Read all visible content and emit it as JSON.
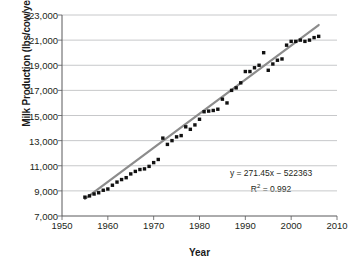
{
  "chart_data": {
    "type": "scatter",
    "title": "",
    "xlabel": "Year",
    "ylabel": "Milk Production (lbs/cow/year)",
    "xlim": [
      1950,
      2010
    ],
    "ylim": [
      7000,
      23000
    ],
    "xticks": [
      "1950",
      "1960",
      "1970",
      "1980",
      "1990",
      "2000",
      "2010"
    ],
    "xtick_values": [
      1950,
      1960,
      1970,
      1980,
      1990,
      2000,
      2010
    ],
    "yticks": [
      "7,000",
      "9,000",
      "11,000",
      "13,000",
      "15,000",
      "17,000",
      "19,000",
      "21,000",
      "23,000"
    ],
    "ytick_values": [
      7000,
      9000,
      11000,
      13000,
      15000,
      17000,
      19000,
      21000,
      23000
    ],
    "grid": "horizontal",
    "legend": "none",
    "marker_color": "#111111",
    "trendline_color": "#8c8c8c",
    "annotations": [
      "y = 271.45x − 522363",
      "R² = 0.992"
    ],
    "equation": "y = 271.45x − 522363",
    "r_squared_label": "R",
    "r_squared_sup": "2",
    "r_squared_value": "= 0.992",
    "slope": 271.45,
    "intercept": -522363,
    "r_squared": 0.992,
    "series": [
      {
        "name": "Milk production per cow",
        "x": [
          1955,
          1956,
          1957,
          1958,
          1959,
          1960,
          1961,
          1962,
          1963,
          1964,
          1965,
          1966,
          1967,
          1968,
          1969,
          1970,
          1971,
          1972,
          1973,
          1974,
          1975,
          1976,
          1977,
          1978,
          1979,
          1980,
          1981,
          1982,
          1983,
          1984,
          1985,
          1986,
          1987,
          1988,
          1989,
          1990,
          1991,
          1992,
          1993,
          1994,
          1995,
          1996,
          1997,
          1998,
          1999,
          2000,
          2001,
          2002,
          2003,
          2004,
          2005,
          2006
        ],
        "y": [
          8500,
          8600,
          8750,
          8850,
          9050,
          9150,
          9450,
          9700,
          9900,
          10050,
          10350,
          10550,
          10700,
          10750,
          10950,
          11250,
          11500,
          13200,
          12700,
          13000,
          13300,
          13400,
          14100,
          13900,
          14250,
          14700,
          15300,
          15350,
          15400,
          15500,
          16300,
          16000,
          17000,
          17200,
          17600,
          18500,
          18500,
          18800,
          19000,
          20000,
          18600,
          19100,
          19400,
          19500,
          20600,
          20900,
          20900,
          21000,
          20900,
          21000,
          21200,
          21300
        ]
      }
    ],
    "trendline": {
      "x_start": 1955,
      "y_start": 8360,
      "x_end": 2006,
      "y_end": 22202
    }
  },
  "axes": {
    "y_title": "Milk Production (lbs/cow/year)",
    "x_title": "Year"
  }
}
